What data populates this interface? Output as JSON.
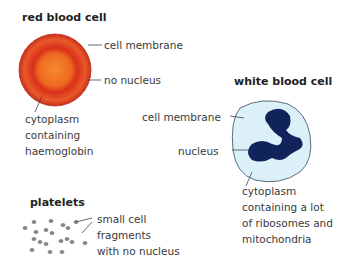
{
  "red_blood_cell": {
    "title": "red blood cell",
    "labels": {
      "membrane": "cell membrane",
      "nucleus": "no nucleus",
      "cytoplasm": [
        "cytoplasm",
        "containing",
        "haemoglobin"
      ]
    },
    "colors": {
      "outer": "#d8331e",
      "inner": "#f07a2a",
      "ring": "#e85a25"
    }
  },
  "white_blood_cell": {
    "title": "white blood cell",
    "labels": {
      "membrane": "cell membrane",
      "nucleus": "nucleus",
      "cytoplasm": [
        "cytoplasm",
        "containing a lot",
        "of ribosomes and",
        "mitochondria"
      ]
    },
    "colors": {
      "cytoplasm": "#dcf0fa",
      "outline": "#5a6f80",
      "nucleus": "#10235a"
    }
  },
  "platelets": {
    "title": "platelets",
    "labels": [
      "small cell",
      "fragments",
      "with no nucleus"
    ],
    "colors": {
      "fill": "#8a8a8a"
    }
  }
}
